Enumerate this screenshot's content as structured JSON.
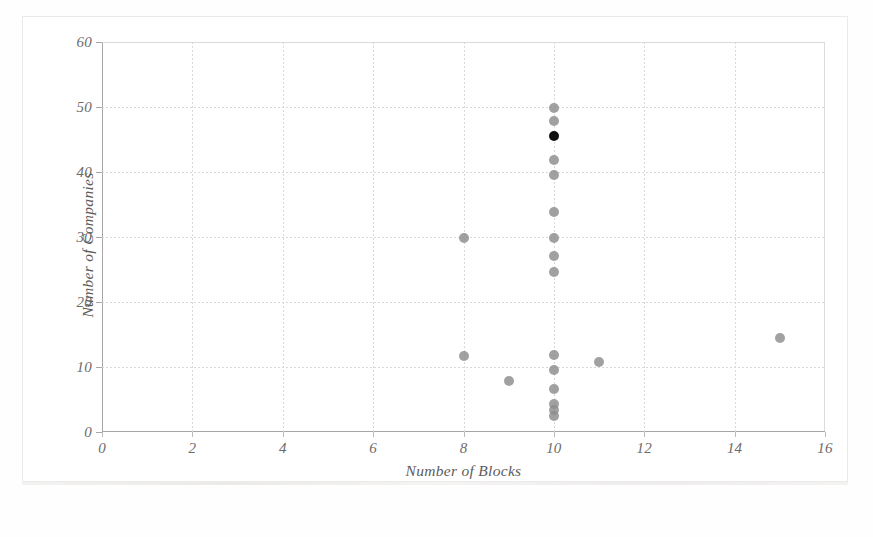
{
  "chart_data": {
    "type": "scatter",
    "title": "",
    "xlabel": "Number of Blocks",
    "ylabel": "Number of Companies",
    "xlim": [
      0,
      16
    ],
    "ylim": [
      0,
      60
    ],
    "xticks": [
      0,
      2,
      4,
      6,
      8,
      10,
      12,
      14,
      16
    ],
    "yticks": [
      0,
      10,
      20,
      30,
      40,
      50,
      60
    ],
    "grid": true,
    "legend": "none",
    "marker_color": "#8c8c8c",
    "highlight_color": "#101010",
    "points": [
      {
        "x": 10,
        "y": 49.8,
        "color": "#8c8c8c"
      },
      {
        "x": 10,
        "y": 47.8,
        "color": "#8c8c8c"
      },
      {
        "x": 10,
        "y": 45.5,
        "color": "#101010"
      },
      {
        "x": 10,
        "y": 41.8,
        "color": "#8c8c8c"
      },
      {
        "x": 10,
        "y": 39.6,
        "color": "#8c8c8c"
      },
      {
        "x": 10,
        "y": 33.8,
        "color": "#8c8c8c"
      },
      {
        "x": 10,
        "y": 29.9,
        "color": "#8c8c8c"
      },
      {
        "x": 10,
        "y": 27.1,
        "color": "#8c8c8c"
      },
      {
        "x": 10,
        "y": 24.6,
        "color": "#8c8c8c"
      },
      {
        "x": 10,
        "y": 11.8,
        "color": "#8c8c8c"
      },
      {
        "x": 10,
        "y": 9.6,
        "color": "#8c8c8c"
      },
      {
        "x": 10,
        "y": 6.6,
        "color": "#8c8c8c"
      },
      {
        "x": 10,
        "y": 4.3,
        "color": "#8c8c8c"
      },
      {
        "x": 10,
        "y": 3.4,
        "color": "#8c8c8c"
      },
      {
        "x": 10,
        "y": 2.4,
        "color": "#8c8c8c"
      },
      {
        "x": 8,
        "y": 29.9,
        "color": "#8c8c8c"
      },
      {
        "x": 8,
        "y": 11.7,
        "color": "#8c8c8c"
      },
      {
        "x": 9,
        "y": 7.8,
        "color": "#8c8c8c"
      },
      {
        "x": 11,
        "y": 10.7,
        "color": "#8c8c8c"
      },
      {
        "x": 15,
        "y": 14.5,
        "color": "#8c8c8c"
      }
    ]
  }
}
